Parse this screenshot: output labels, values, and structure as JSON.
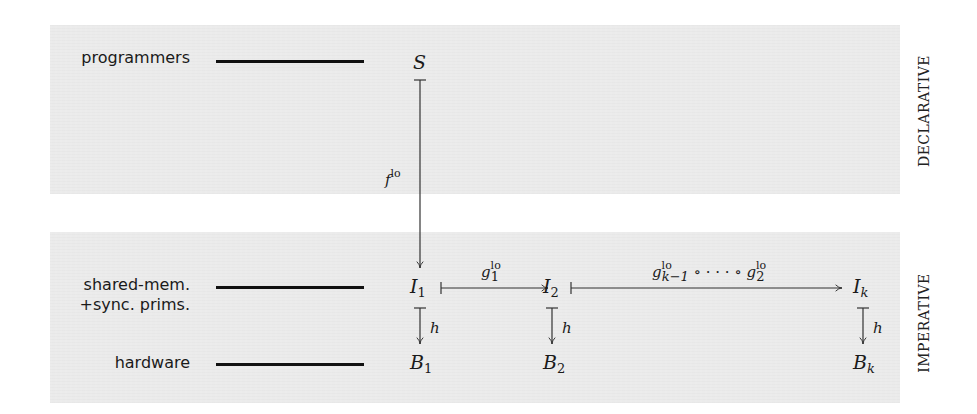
{
  "panels": {
    "declarative": {
      "side_label": "DECLARATIVE"
    },
    "imperative": {
      "side_label": "IMPERATIVE"
    }
  },
  "layers": [
    {
      "label_lines": [
        "programmers"
      ]
    },
    {
      "label_lines": [
        "shared-mem.",
        "+sync. prims."
      ]
    },
    {
      "label_lines": [
        "hardware"
      ]
    }
  ],
  "nodes": {
    "S": {
      "base": "S",
      "sub": ""
    },
    "I1": {
      "base": "I",
      "sub": "1"
    },
    "I2": {
      "base": "I",
      "sub": "2"
    },
    "Ik": {
      "base": "I",
      "sub": "k"
    },
    "B1": {
      "base": "B",
      "sub": "1"
    },
    "B2": {
      "base": "B",
      "sub": "2"
    },
    "Bk": {
      "base": "B",
      "sub": "k"
    }
  },
  "edges": {
    "f": {
      "base": "f",
      "sup": "lo",
      "from": "S",
      "to": "I1"
    },
    "g1": {
      "base": "g",
      "sub": "1",
      "sup": "lo",
      "from": "I1",
      "to": "I2"
    },
    "gchain": {
      "first_base": "g",
      "first_sub": "k−1",
      "first_sup": "lo",
      "compose": " ∘ · · · ∘ ",
      "last_base": "g",
      "last_sub": "2",
      "last_sup": "lo",
      "from": "I2",
      "to": "Ik"
    },
    "h": {
      "label": "h"
    }
  },
  "colors": {
    "panel_bg": "#ebebeb",
    "ink": "#1a1a1a"
  }
}
